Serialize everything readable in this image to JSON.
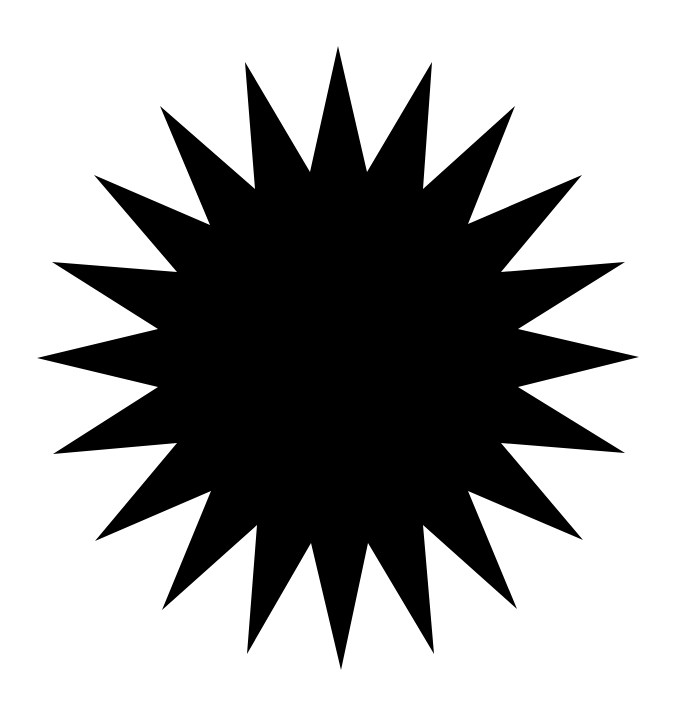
{
  "canvas": {
    "width": 678,
    "height": 719,
    "background": "#ffffff"
  },
  "shape": {
    "type": "starburst",
    "points_count": 18,
    "fill": "#000000",
    "polygon": "338,46 367,172 432,62 423,189 515,106 468,224 582,175 501,272 625,262 518,329 639,357 518,387 625,453 501,443 583,540 468,491 517,609 423,525 434,654 368,543 341,670 311,543 247,654 257,525 162,610 211,491 95,541 177,443 53,454 158,387 37,358 158,329 52,262 177,272 94,175 210,225 160,106 255,189 245,62 310,172"
  }
}
